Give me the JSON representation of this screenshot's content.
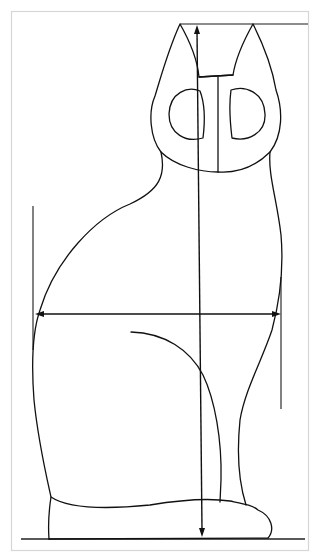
{
  "figure": {
    "colors": {
      "ink": "#111111",
      "frame": "#d6d6d6",
      "background": "#ffffff"
    },
    "elements": {
      "height_arrow": "vertical height measurement arrow (ear tip to ground)",
      "width_arrow": "horizontal width measurement arrow (widest body point)",
      "left_guide": "left vertical guide line",
      "right_guide": "right vertical guide line",
      "top_line": "top reference line at ear tips",
      "ground_line": "ground reference line"
    }
  }
}
